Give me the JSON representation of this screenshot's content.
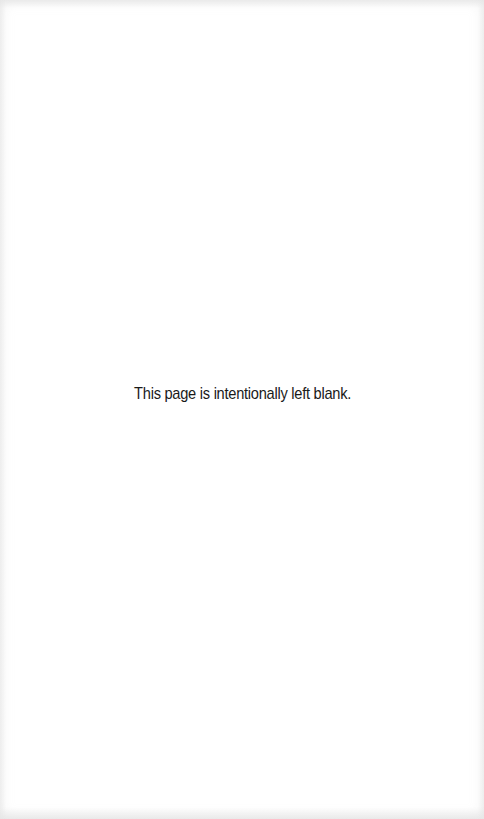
{
  "page": {
    "notice_text": "This page is intentionally left blank.",
    "background_color": "#ffffff",
    "text_color": "#1a1a1a"
  }
}
